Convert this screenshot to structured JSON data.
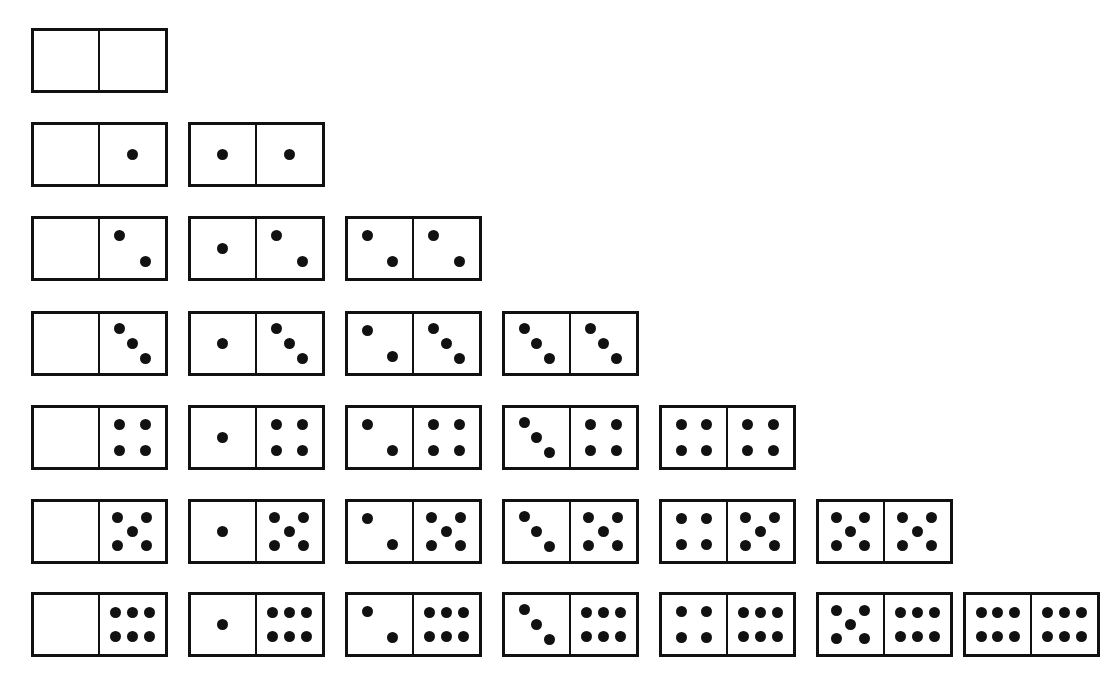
{
  "figure": {
    "name": "double-six-domino-set",
    "total_tiles": 28,
    "max_pips": 6,
    "background_color": "#ffffff",
    "line_color": "#111111",
    "pip_color": "#111111"
  },
  "geometry": {
    "tile_width": 137,
    "tile_height": 65,
    "column_pitch": 157,
    "row_pitch": 94,
    "origin_x": 31,
    "origin_y": 28,
    "pip_diameter": 11,
    "border_width": 3,
    "divider_width": 2
  },
  "pip_layouts": {
    "0": [],
    "1": [
      [
        50,
        50
      ]
    ],
    "2": [
      [
        30,
        28
      ],
      [
        70,
        72
      ]
    ],
    "3": [
      [
        30,
        24
      ],
      [
        50,
        50
      ],
      [
        70,
        76
      ]
    ],
    "4": [
      [
        30,
        28
      ],
      [
        70,
        28
      ],
      [
        30,
        72
      ],
      [
        70,
        72
      ]
    ],
    "5": [
      [
        28,
        26
      ],
      [
        72,
        26
      ],
      [
        50,
        50
      ],
      [
        28,
        74
      ],
      [
        72,
        74
      ]
    ],
    "6": [
      [
        24,
        30
      ],
      [
        50,
        30
      ],
      [
        76,
        30
      ],
      [
        24,
        70
      ],
      [
        50,
        70
      ],
      [
        76,
        70
      ]
    ]
  },
  "rows": [
    {
      "index": 0,
      "label": "row-blanks",
      "tiles": [
        {
          "left": 0,
          "right": 0,
          "name": "domino-0-0",
          "x": 31
        }
      ]
    },
    {
      "index": 1,
      "label": "row-ones",
      "tiles": [
        {
          "left": 0,
          "right": 1,
          "name": "domino-0-1",
          "x": 31
        },
        {
          "left": 1,
          "right": 1,
          "name": "domino-1-1",
          "x": 188
        }
      ]
    },
    {
      "index": 2,
      "label": "row-twos",
      "tiles": [
        {
          "left": 0,
          "right": 2,
          "name": "domino-0-2",
          "x": 31
        },
        {
          "left": 1,
          "right": 2,
          "name": "domino-1-2",
          "x": 188
        },
        {
          "left": 2,
          "right": 2,
          "name": "domino-2-2",
          "x": 345
        }
      ]
    },
    {
      "index": 3,
      "label": "row-threes",
      "tiles": [
        {
          "left": 0,
          "right": 3,
          "name": "domino-0-3",
          "x": 31
        },
        {
          "left": 1,
          "right": 3,
          "name": "domino-1-3",
          "x": 188
        },
        {
          "left": 2,
          "right": 3,
          "name": "domino-2-3",
          "x": 345
        },
        {
          "left": 3,
          "right": 3,
          "name": "domino-3-3",
          "x": 502
        }
      ]
    },
    {
      "index": 4,
      "label": "row-fours",
      "tiles": [
        {
          "left": 0,
          "right": 4,
          "name": "domino-0-4",
          "x": 31
        },
        {
          "left": 1,
          "right": 4,
          "name": "domino-1-4",
          "x": 188
        },
        {
          "left": 2,
          "right": 4,
          "name": "domino-2-4",
          "x": 345
        },
        {
          "left": 3,
          "right": 4,
          "name": "domino-3-4",
          "x": 502
        },
        {
          "left": 4,
          "right": 4,
          "name": "domino-4-4",
          "x": 659
        }
      ]
    },
    {
      "index": 5,
      "label": "row-fives",
      "tiles": [
        {
          "left": 0,
          "right": 5,
          "name": "domino-0-5",
          "x": 31
        },
        {
          "left": 1,
          "right": 5,
          "name": "domino-1-5",
          "x": 188
        },
        {
          "left": 2,
          "right": 5,
          "name": "domino-2-5",
          "x": 345
        },
        {
          "left": 3,
          "right": 5,
          "name": "domino-3-5",
          "x": 502
        },
        {
          "left": 4,
          "right": 5,
          "name": "domino-4-5",
          "x": 659
        },
        {
          "left": 5,
          "right": 5,
          "name": "domino-5-5",
          "x": 816
        }
      ]
    },
    {
      "index": 6,
      "label": "row-sixes",
      "tiles": [
        {
          "left": 0,
          "right": 6,
          "name": "domino-0-6",
          "x": 31
        },
        {
          "left": 1,
          "right": 6,
          "name": "domino-1-6",
          "x": 188
        },
        {
          "left": 2,
          "right": 6,
          "name": "domino-2-6",
          "x": 345
        },
        {
          "left": 3,
          "right": 6,
          "name": "domino-3-6",
          "x": 502
        },
        {
          "left": 4,
          "right": 6,
          "name": "domino-4-6",
          "x": 659
        },
        {
          "left": 5,
          "right": 6,
          "name": "domino-5-6",
          "x": 816
        },
        {
          "left": 6,
          "right": 6,
          "name": "domino-6-6",
          "x": 963
        }
      ]
    }
  ]
}
